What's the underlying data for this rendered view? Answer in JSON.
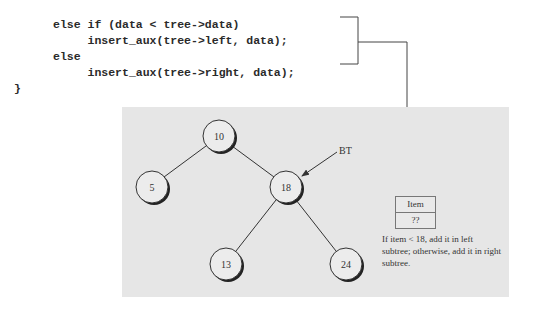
{
  "code": {
    "lines": [
      "else if (data < tree->data)",
      "     insert_aux(tree->left, data);",
      "else",
      "     insert_aux(tree->right, data);",
      "}"
    ]
  },
  "tree": {
    "nodes": [
      {
        "id": "n10",
        "label": "10",
        "cx": 219,
        "cy": 136
      },
      {
        "id": "n5",
        "label": "5",
        "cx": 152,
        "cy": 187
      },
      {
        "id": "n18",
        "label": "18",
        "cx": 286,
        "cy": 187
      },
      {
        "id": "n13",
        "label": "13",
        "cx": 226,
        "cy": 264
      },
      {
        "id": "n24",
        "label": "24",
        "cx": 346,
        "cy": 264
      }
    ],
    "pointer_label": "BT"
  },
  "item_box": {
    "header": "Item",
    "value": "??"
  },
  "note": "If item < 18, add it in left subtree; otherwise, add it in right subtree.",
  "colors": {
    "panel": "#e6e6e6",
    "node_fill": "#ececec",
    "line": "#333333"
  }
}
